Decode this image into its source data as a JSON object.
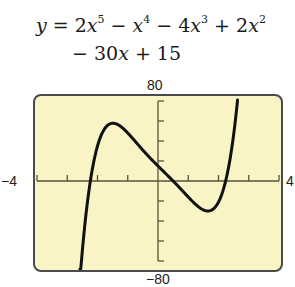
{
  "equation": {
    "line1": {
      "lhs": "y",
      "eq": " = ",
      "t1_coef": "2",
      "t1_var": "x",
      "t1_exp": "5",
      "op2": " − ",
      "t2_var": "x",
      "t2_exp": "4",
      "op3": " − 4",
      "t3_var": "x",
      "t3_exp": "3",
      "op4": " + 2",
      "t4_var": "x",
      "t4_exp": "2"
    },
    "line2": {
      "op5": "− 30",
      "t5_var": "x",
      "op6": " + 15"
    }
  },
  "window": {
    "ymax_label": "80",
    "ymin_label": "−80",
    "xmin_label": "−4",
    "xmax_label": "4",
    "background": "#F8F4C6",
    "frame_color": "#4a4a4a",
    "curve_color": "#111111"
  },
  "chart_data": {
    "type": "line",
    "xlabel": "",
    "ylabel": "",
    "xlim": [
      -4,
      4
    ],
    "ylim": [
      -80,
      80
    ],
    "x_tick_step": 1,
    "y_tick_step": 20,
    "grid": false,
    "series": [
      {
        "name": "y = 2x^5 − x^4 − 4x^3 + 2x^2 − 30x + 15",
        "x": [
          -2.58,
          -2.5,
          -2.25,
          -2.0,
          -1.75,
          -1.5,
          -1.25,
          -1.0,
          -0.5,
          0.0,
          0.5,
          1.0,
          1.5,
          1.75,
          2.0,
          2.25,
          2.5,
          2.63
        ],
        "y": [
          -80,
          -69.4,
          -2.7,
          35.0,
          52.8,
          57.8,
          54.9,
          48.0,
          30.9,
          15.0,
          0.0,
          -16.0,
          -28.9,
          -29.4,
          -21.0,
          1.7,
          46.2,
          80
        ]
      }
    ]
  }
}
